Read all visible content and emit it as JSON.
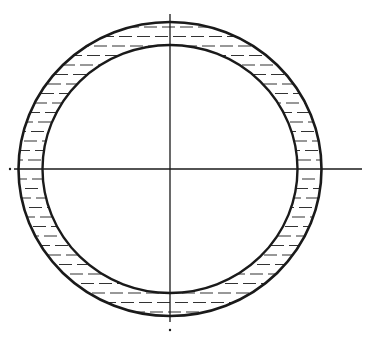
{
  "diagram": {
    "type": "annular-ring-cross-section",
    "center": {
      "x": 170,
      "y": 169
    },
    "outer_circle": {
      "rx": 151.5,
      "ry": 147
    },
    "inner_circle": {
      "rx": 127.5,
      "ry": 124
    },
    "hatch": {
      "style": "horizontal-dashed",
      "spacing": 9.5
    },
    "axes": {
      "horizontal": {
        "x1": 14,
        "x2": 362,
        "y": 169,
        "end_dot_x": 10
      },
      "vertical": {
        "x": 170,
        "y1": 14,
        "y2": 322,
        "end_dot_y": 330
      }
    },
    "colors": {
      "line": "#1a1a1a",
      "hatch": "#333333",
      "background": "#ffffff"
    }
  }
}
